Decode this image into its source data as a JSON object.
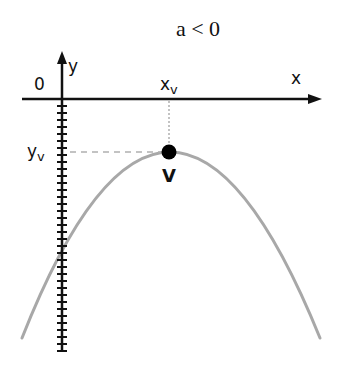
{
  "diagram": {
    "title": "a < 0",
    "axes": {
      "x_label": "x",
      "y_label": "y",
      "origin_label": "0"
    },
    "vertex": {
      "label": "V",
      "x_label": "x",
      "x_subscript": "v",
      "y_label": "y",
      "y_subscript": "v"
    },
    "curve": {
      "type": "downward parabola",
      "color": "#a8a8a8"
    },
    "colors": {
      "axis": "#111111",
      "vertex_dot": "#000000",
      "guide_lines": "#b0b0b0"
    }
  }
}
